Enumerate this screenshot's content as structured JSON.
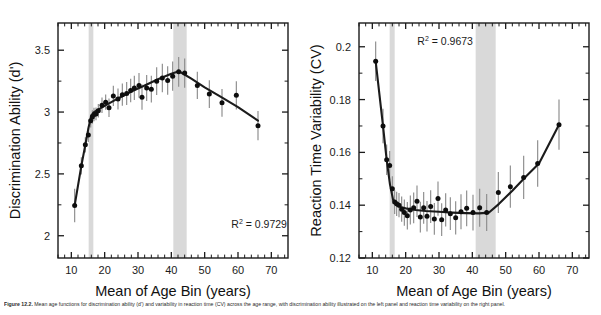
{
  "figure": {
    "caption_label": "Figure 12.2.",
    "caption_text": "Mean age functions for discrimination ability (d') and variability in reaction time (CV) across the age range, with discrimination ability illustrated on the left panel and reaction time variability on the right panel."
  },
  "chart_data": [
    {
      "id": "discrimination",
      "type": "scatter",
      "title": "",
      "xlabel": "Mean of Age Bin (years)",
      "ylabel": "Discrimination Ability (d')",
      "xlim": [
        6,
        75
      ],
      "ylim": [
        1.82,
        3.72
      ],
      "xticks": [
        10,
        20,
        30,
        40,
        50,
        60,
        70
      ],
      "yticks": [
        2,
        2.5,
        3,
        3.5
      ],
      "ytick_labels": [
        "2",
        "2.5",
        "3",
        "3.5"
      ],
      "xtick_labels": [
        "10",
        "20",
        "30",
        "40",
        "50",
        "60",
        "70"
      ],
      "minor_tick_step": 2,
      "grid": false,
      "legend": "none",
      "annotation": {
        "label": "R",
        "sup": "2",
        "value": "= 0.9729",
        "x": 58,
        "y": 2.06
      },
      "bands": [
        {
          "x0": 15.2,
          "x1": 16.6,
          "color": "#d9d9d9"
        },
        {
          "x0": 40.6,
          "x1": 44.6,
          "color": "#d9d9d9"
        }
      ],
      "x": [
        11.0,
        13.0,
        14.2,
        15.1,
        15.8,
        16.3,
        16.8,
        17.4,
        18.1,
        19.2,
        20.3,
        21.3,
        22.6,
        24.0,
        25.3,
        26.6,
        27.8,
        28.9,
        30.3,
        31.2,
        32.6,
        34.0,
        35.6,
        37.3,
        38.9,
        40.4,
        42.2,
        44.0,
        47.8,
        51.4,
        55.2,
        59.5,
        66.0
      ],
      "y": [
        2.245,
        2.565,
        2.735,
        2.815,
        2.93,
        2.96,
        2.98,
        2.985,
        3.01,
        3.055,
        3.08,
        3.035,
        3.13,
        3.105,
        3.14,
        3.15,
        3.175,
        3.195,
        3.215,
        3.12,
        3.195,
        3.185,
        3.25,
        3.275,
        3.255,
        3.29,
        3.325,
        3.315,
        3.215,
        3.145,
        3.075,
        3.135,
        2.89
      ],
      "yerr": [
        0.135,
        0.07,
        0.062,
        0.058,
        0.055,
        0.055,
        0.055,
        0.052,
        0.055,
        0.062,
        0.062,
        0.075,
        0.082,
        0.085,
        0.09,
        0.092,
        0.095,
        0.098,
        0.1,
        0.102,
        0.105,
        0.108,
        0.112,
        0.115,
        0.115,
        0.118,
        0.12,
        0.118,
        0.11,
        0.112,
        0.112,
        0.115,
        0.118
      ],
      "fit_x": [
        11.0,
        13.0,
        14.2,
        15.2,
        16.0,
        16.8,
        18.0,
        20.0,
        24.0,
        28.0,
        32.0,
        36.0,
        40.0,
        42.3,
        46.0,
        50.0,
        55.0,
        60.0,
        66.0
      ],
      "fit_y": [
        2.245,
        2.565,
        2.735,
        2.88,
        2.97,
        3.0,
        3.02,
        3.05,
        3.11,
        3.165,
        3.215,
        3.265,
        3.31,
        3.33,
        3.27,
        3.2,
        3.12,
        3.04,
        2.93
      ],
      "note": "Values estimated from plotted markers; error bars are +/- 1 SE."
    },
    {
      "id": "rt-variability",
      "type": "scatter",
      "title": "",
      "xlabel": "Mean of Age Bin (years)",
      "ylabel": "Reaction Time Variability (CV)",
      "xlim": [
        6,
        75
      ],
      "ylim": [
        0.12,
        0.209
      ],
      "xticks": [
        10,
        20,
        30,
        40,
        50,
        60,
        70
      ],
      "yticks": [
        0.12,
        0.14,
        0.16,
        0.18,
        0.2
      ],
      "ytick_labels": [
        "0.12",
        "0.14",
        "0.16",
        "0.18",
        "0.2"
      ],
      "xtick_labels": [
        "10",
        "20",
        "30",
        "40",
        "50",
        "60",
        "70"
      ],
      "minor_tick_step": 2,
      "grid": false,
      "legend": "none",
      "annotation": {
        "label": "R",
        "sup": "2",
        "value": "= 0.9673",
        "x": 23.5,
        "y": 0.2005
      },
      "bands": [
        {
          "x0": 15.2,
          "x1": 16.7,
          "color": "#d9d9d9"
        },
        {
          "x0": 41.0,
          "x1": 47.0,
          "color": "#d9d9d9"
        }
      ],
      "x": [
        11.0,
        13.2,
        14.3,
        15.2,
        16.0,
        16.7,
        17.3,
        18.0,
        18.8,
        19.6,
        20.5,
        21.4,
        22.4,
        23.4,
        24.4,
        25.4,
        26.4,
        27.5,
        28.6,
        29.7,
        30.8,
        32.0,
        33.4,
        35.0,
        36.6,
        38.3,
        40.2,
        42.2,
        44.3,
        47.8,
        51.4,
        55.4,
        59.6,
        66.0
      ],
      "y": [
        0.1945,
        0.17,
        0.1572,
        0.155,
        0.1462,
        0.1412,
        0.1405,
        0.14,
        0.1385,
        0.1372,
        0.136,
        0.1382,
        0.139,
        0.1415,
        0.1355,
        0.139,
        0.1358,
        0.1395,
        0.1348,
        0.1425,
        0.1345,
        0.1382,
        0.1368,
        0.1352,
        0.1375,
        0.1388,
        0.1372,
        0.139,
        0.1372,
        0.1448,
        0.147,
        0.1505,
        0.1558,
        0.1705
      ],
      "yerr": [
        0.0075,
        0.0065,
        0.0058,
        0.0055,
        0.0048,
        0.0045,
        0.0046,
        0.0046,
        0.0048,
        0.005,
        0.0052,
        0.0055,
        0.0058,
        0.006,
        0.0058,
        0.006,
        0.0058,
        0.0062,
        0.006,
        0.0065,
        0.0062,
        0.0063,
        0.0062,
        0.0063,
        0.0066,
        0.0068,
        0.0068,
        0.0072,
        0.007,
        0.0078,
        0.008,
        0.0082,
        0.0088,
        0.0095
      ],
      "fit_x": [
        11.0,
        13.2,
        14.3,
        15.3,
        16.2,
        17.2,
        18.5,
        20.0,
        23.0,
        26.0,
        30.0,
        34.0,
        38.0,
        42.0,
        45.0,
        48.0,
        52.0,
        56.0,
        60.0,
        66.0
      ],
      "fit_y": [
        0.1945,
        0.17,
        0.1572,
        0.1478,
        0.1422,
        0.14,
        0.1393,
        0.1388,
        0.1382,
        0.1378,
        0.1375,
        0.1372,
        0.137,
        0.1369,
        0.1372,
        0.1405,
        0.1455,
        0.1508,
        0.1558,
        0.1705
      ],
      "note": "Values estimated from plotted markers; error bars are +/- 1 SE."
    }
  ]
}
